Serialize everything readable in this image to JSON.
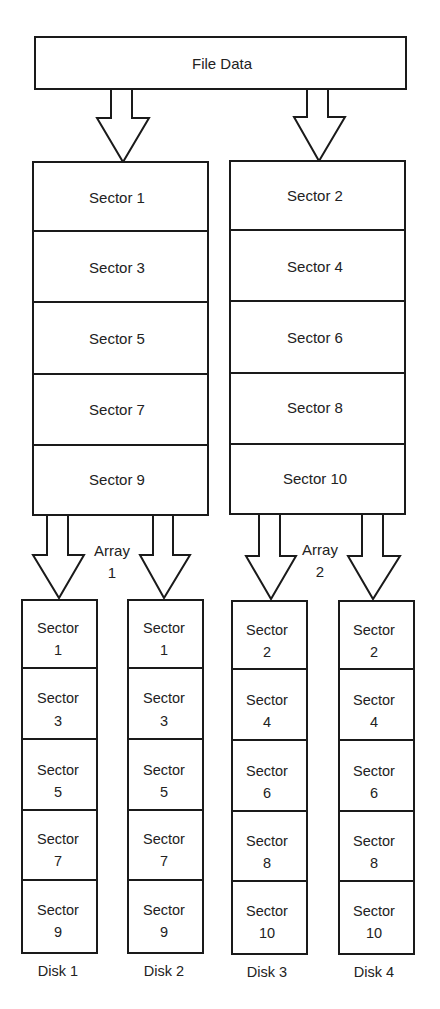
{
  "diagram": {
    "file_data": {
      "label": "File Data"
    },
    "arrays": [
      {
        "label_line1": "Array",
        "label_line2": "1",
        "sectors": [
          "Sector 1",
          "Sector 3",
          "Sector 5",
          "Sector 7",
          "Sector 9"
        ],
        "disks": [
          {
            "label": "Disk 1",
            "sectors": [
              [
                "Sector",
                "1"
              ],
              [
                "Sector",
                "3"
              ],
              [
                "Sector",
                "5"
              ],
              [
                "Sector",
                "7"
              ],
              [
                "Sector",
                "9"
              ]
            ]
          },
          {
            "label": "Disk 2",
            "sectors": [
              [
                "Sector",
                "1"
              ],
              [
                "Sector",
                "3"
              ],
              [
                "Sector",
                "5"
              ],
              [
                "Sector",
                "7"
              ],
              [
                "Sector",
                "9"
              ]
            ]
          }
        ]
      },
      {
        "label_line1": "Array",
        "label_line2": "2",
        "sectors": [
          "Sector 2",
          "Sector 4",
          "Sector 6",
          "Sector 8",
          "Sector 10"
        ],
        "disks": [
          {
            "label": "Disk 3",
            "sectors": [
              [
                "Sector",
                "2"
              ],
              [
                "Sector",
                "4"
              ],
              [
                "Sector",
                "6"
              ],
              [
                "Sector",
                "8"
              ],
              [
                "Sector",
                "10"
              ]
            ]
          },
          {
            "label": "Disk 4",
            "sectors": [
              [
                "Sector",
                "2"
              ],
              [
                "Sector",
                "4"
              ],
              [
                "Sector",
                "6"
              ],
              [
                "Sector",
                "8"
              ],
              [
                "Sector",
                "10"
              ]
            ]
          }
        ]
      }
    ]
  }
}
